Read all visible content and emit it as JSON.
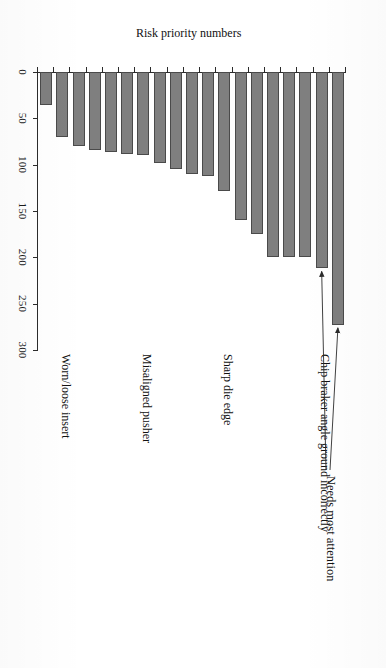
{
  "figure": {
    "annotation": {
      "text": "Needs most attention",
      "points_to": [
        1,
        2
      ]
    },
    "value_axis_title": "Risk priority numbers",
    "category_labels": [
      {
        "index": 0,
        "text": "Chip braker angle ground incorrectly"
      },
      {
        "index": 6,
        "text": "Sharp die edge"
      },
      {
        "index": 11,
        "text": "Misaligned pusher"
      },
      {
        "index": 16,
        "text": "Worn/loose insert"
      }
    ],
    "colors": {
      "bar_fill": "#7f7f7f",
      "bar_border": "#4a4a4a",
      "axis": "#2b2b2b",
      "text": "#111111",
      "background": "#ffffff"
    }
  },
  "chart_data": {
    "type": "bar",
    "orientation": "vertical-printed-sideways",
    "title": "",
    "xlabel": "",
    "ylabel": "Risk priority numbers",
    "ylim": [
      0,
      300
    ],
    "yticks": [
      0,
      50,
      100,
      150,
      200,
      250,
      300
    ],
    "grid": false,
    "legend": "none",
    "categories": [
      "Chip braker angle ground incorrectly",
      "",
      "",
      "",
      "",
      "",
      "Sharp die edge",
      "",
      "",
      "",
      "",
      "Misaligned pusher",
      "",
      "",
      "",
      "",
      "Worn/loose insert",
      "",
      ""
    ],
    "values": [
      273,
      212,
      200,
      200,
      200,
      175,
      160,
      128,
      112,
      110,
      105,
      98,
      90,
      88,
      86,
      84,
      80,
      70,
      36
    ],
    "annotations": [
      {
        "text": "Needs most attention",
        "targets": [
          "bar-0",
          "bar-1"
        ]
      }
    ]
  }
}
